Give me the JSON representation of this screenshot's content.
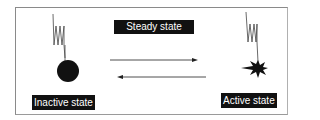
{
  "diagram": {
    "title_label": "Steady state",
    "left_state": {
      "label": "Inactive state",
      "icon": "solid-circle-on-spring"
    },
    "right_state": {
      "label": "Active state",
      "icon": "starburst-on-spring"
    },
    "arrows": [
      {
        "direction": "right",
        "from": "Inactive state",
        "to": "Active state"
      },
      {
        "direction": "left",
        "from": "Active state",
        "to": "Inactive state"
      }
    ],
    "colors": {
      "foreground": "#111111",
      "background": "#ffffff",
      "frame": "#8a8a8a"
    }
  }
}
